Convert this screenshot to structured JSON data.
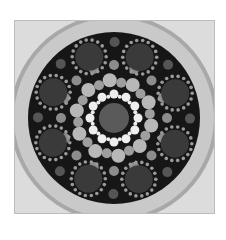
{
  "image": {
    "subject": "dot-painted mandala stone",
    "palette": {
      "paper": "#ffffff",
      "stone": "#c9c9c9",
      "stone_dark": "#a8a8a8",
      "disc": "#161616",
      "center": "#5a5a5a",
      "inner_ring": "#eeeeee",
      "mid_dots": "#b8b8b8",
      "outer_dots": "#8c8c8c",
      "rosette": "#3a3a3a",
      "rosette_dots": "#9a9a9a"
    }
  }
}
